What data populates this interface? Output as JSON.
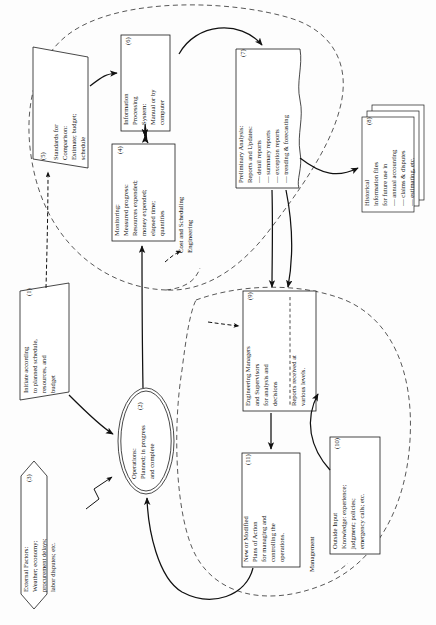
{
  "diagram": {
    "orientation": "rotated-90-ccw",
    "zones": [
      {
        "id": "zone-cost-scheduling",
        "label": "Cost and Scheduling\nEngineering"
      },
      {
        "id": "zone-management",
        "label": "Management"
      }
    ],
    "zone_labels": {
      "cost_scheduling_line1": "Cost and Scheduling",
      "cost_scheduling_line2": "Engineering",
      "management": "Management"
    },
    "nodes": [
      {
        "id": "node-1",
        "number": "(1)",
        "shape": "parallelogram",
        "lines": [
          "Initiate according",
          "to planned schedule,",
          "resources, and",
          "budget"
        ]
      },
      {
        "id": "node-2",
        "number": "(2)",
        "shape": "double-ellipse",
        "lines": [
          "Operations:",
          "Planned; in progress",
          "and complete"
        ]
      },
      {
        "id": "node-3",
        "number": "(3)",
        "shape": "hexagon",
        "lines": [
          "External Factors:",
          "Weather; economy;",
          "procurement delays;",
          "labor disputes; etc."
        ]
      },
      {
        "id": "node-4",
        "number": "(4)",
        "shape": "rectangle",
        "lines": [
          "Monitoring:",
          "Measured progress:",
          "Resources expended;",
          "money expended;",
          "elapsed time;",
          "quantities"
        ]
      },
      {
        "id": "node-5",
        "number": "(5)",
        "shape": "parallelogram",
        "lines": [
          "Standards for",
          "Comparison:",
          "Estimate; budget;",
          "schedule"
        ]
      },
      {
        "id": "node-6",
        "number": "(6)",
        "shape": "rectangle",
        "lines": [
          "Information",
          "Processing",
          "System:",
          "Manual or by",
          "computer"
        ]
      },
      {
        "id": "node-7",
        "number": "(7)",
        "shape": "document",
        "lines": [
          "Preliminary Analysis:",
          "Reports and Updates:",
          "— detail reports",
          "— summary reports",
          "— exception reports",
          "— trending & forecasting"
        ]
      },
      {
        "id": "node-8",
        "number": "(8)",
        "shape": "stacked-rectangles",
        "lines": [
          "Historical",
          "information files",
          "for future use in",
          "— annual accounting",
          "— claims & disputes",
          "— estimating, etc."
        ]
      },
      {
        "id": "node-9",
        "number": "(9)",
        "shape": "rectangle-split",
        "lines": [
          "Engineering Managers",
          "and Supervisors",
          "for analysis and",
          "decisions"
        ],
        "lines_second": [
          "Reports received at",
          "various levels."
        ]
      },
      {
        "id": "node-10",
        "number": "(10)",
        "shape": "rectangle",
        "lines": [
          "Outside Input",
          "Knowledge: experience;",
          "judgment; policies;",
          "emergency calls; etc."
        ]
      },
      {
        "id": "node-11",
        "number": "(11)",
        "shape": "rectangle",
        "lines": [
          "New or Modified",
          "Plans of Action",
          "for managing and",
          "controlling the",
          "operations."
        ]
      }
    ],
    "colors": {
      "background": "#fdfdfd",
      "stroke": "#111111",
      "dashed_boundary": "#3a3a3a",
      "text": "#111111"
    }
  }
}
